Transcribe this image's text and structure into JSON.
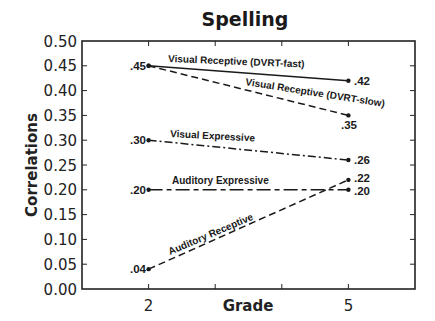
{
  "chart_data": {
    "type": "line",
    "title": "Spelling",
    "xlabel": "Grade",
    "ylabel": "Correlations",
    "x": [
      2,
      5
    ],
    "x_tick_labels": [
      "2",
      "5"
    ],
    "xlim": [
      1,
      6
    ],
    "ylim": [
      0.0,
      0.5
    ],
    "y_ticks": [
      "0.00",
      "0.05",
      "0.10",
      "0.15",
      "0.20",
      "0.25",
      "0.30",
      "0.35",
      "0.40",
      "0.45",
      "0.50"
    ],
    "grid": false,
    "legend": "inline labels on lines",
    "series": [
      {
        "name": "Visual Receptive (DVRT-fast)",
        "values": [
          0.45,
          0.42
        ],
        "value_labels": [
          ".45",
          ".42"
        ],
        "line_style": "solid"
      },
      {
        "name": "Visual Receptive (DVRT-slow)",
        "values": [
          0.45,
          0.35
        ],
        "value_labels": [
          ".45",
          ".35"
        ],
        "line_style": "dashed"
      },
      {
        "name": "Visual Expressive",
        "values": [
          0.3,
          0.26
        ],
        "value_labels": [
          ".30",
          ".26"
        ],
        "line_style": "dash-dot"
      },
      {
        "name": "Auditory Expressive",
        "values": [
          0.2,
          0.2
        ],
        "value_labels": [
          ".20",
          ".20"
        ],
        "line_style": "long-short dash"
      },
      {
        "name": "Auditory Receptive",
        "values": [
          0.04,
          0.22
        ],
        "value_labels": [
          ".04",
          ".22"
        ],
        "line_style": "dashed"
      }
    ]
  },
  "colors": {
    "line": "#1a1a1a",
    "background": "#ffffff"
  }
}
